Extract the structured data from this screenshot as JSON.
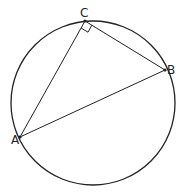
{
  "diagram": {
    "type": "circle-inscribed-right-triangle",
    "circle": {
      "cx": 93,
      "cy": 103,
      "r": 82
    },
    "points": {
      "A": {
        "label": "A",
        "x": 20,
        "y": 137
      },
      "B": {
        "label": "B",
        "x": 165,
        "y": 70
      },
      "C": {
        "label": "C",
        "x": 85,
        "y": 21
      }
    },
    "right_angle_at": "C",
    "segments": [
      "AC",
      "CB",
      "AB"
    ],
    "colors": {
      "stroke": "#222222",
      "background": "#ffffff"
    }
  }
}
